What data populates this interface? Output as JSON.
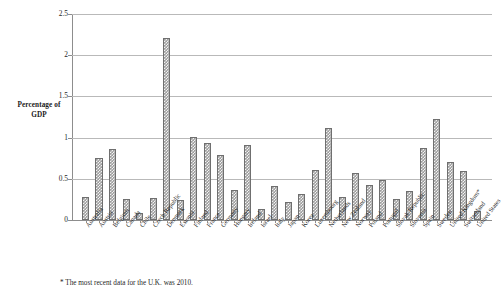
{
  "axis": {
    "y_title_line1": "Percentage of",
    "y_title_line2": "GDP",
    "y_ticks": [
      "2.5",
      "2",
      "1.5",
      "1",
      "0.5",
      "0"
    ]
  },
  "footnote": {
    "text": "* The most recent data for the U.K. was 2010."
  },
  "chart_data": {
    "type": "bar",
    "title": "",
    "xlabel": "",
    "ylabel": "Percentage of GDP",
    "ylim": [
      0,
      2.5
    ],
    "ytick_values": [
      0,
      0.5,
      1,
      1.5,
      2,
      2.5
    ],
    "grid": true,
    "legend": false,
    "bar_fill": "#9d9d9d",
    "bar_edge": "#6f6f6f",
    "categories": [
      "Australia",
      "Austria",
      "Belgium",
      "Canada",
      "Chile",
      "Czech Republic",
      "Denmark",
      "Estonia",
      "Finland",
      "France",
      "Germany",
      "Hungary",
      "Ireland",
      "Israel",
      "Italy",
      "Japan",
      "Korea",
      "Luxembourg",
      "Netherlands",
      "New Zealand",
      "Norway",
      "Poland",
      "Portugal",
      "Slovak Republic",
      "Slovenia",
      "Spain",
      "Sweden",
      "United Kingdom*",
      "Switzerland",
      "United States"
    ],
    "values": [
      0.28,
      0.75,
      0.86,
      0.26,
      0.09,
      0.27,
      2.21,
      0.24,
      1.01,
      0.93,
      0.79,
      0.37,
      0.91,
      0.13,
      0.41,
      0.22,
      0.32,
      0.61,
      1.12,
      0.28,
      0.57,
      0.43,
      0.48,
      0.26,
      0.35,
      0.88,
      1.22,
      0.71,
      0.6,
      0.11
    ]
  }
}
